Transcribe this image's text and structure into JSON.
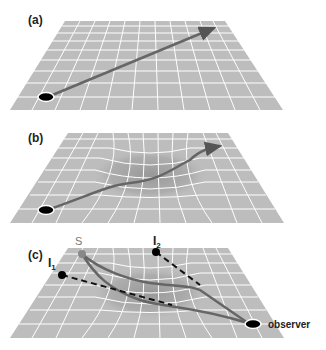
{
  "figure": {
    "panels": [
      {
        "id": "a",
        "label": "(a)",
        "description": "flat grid with straight light ray"
      },
      {
        "id": "b",
        "label": "(b)",
        "description": "grid warped by mass with bent light ray"
      },
      {
        "id": "c",
        "label": "(c)",
        "description": "gravitational lensing with multiple images"
      }
    ],
    "panel_c_labels": {
      "source": "S",
      "image1": "I",
      "image1_sub": "1",
      "image2": "I",
      "image2_sub": "2",
      "observer": "observer"
    },
    "colors": {
      "plane": "#bdbdbd",
      "grid": "#ffffff",
      "ray": "#6a6a6a",
      "dot": "#000000",
      "source_dot": "#888888"
    }
  }
}
